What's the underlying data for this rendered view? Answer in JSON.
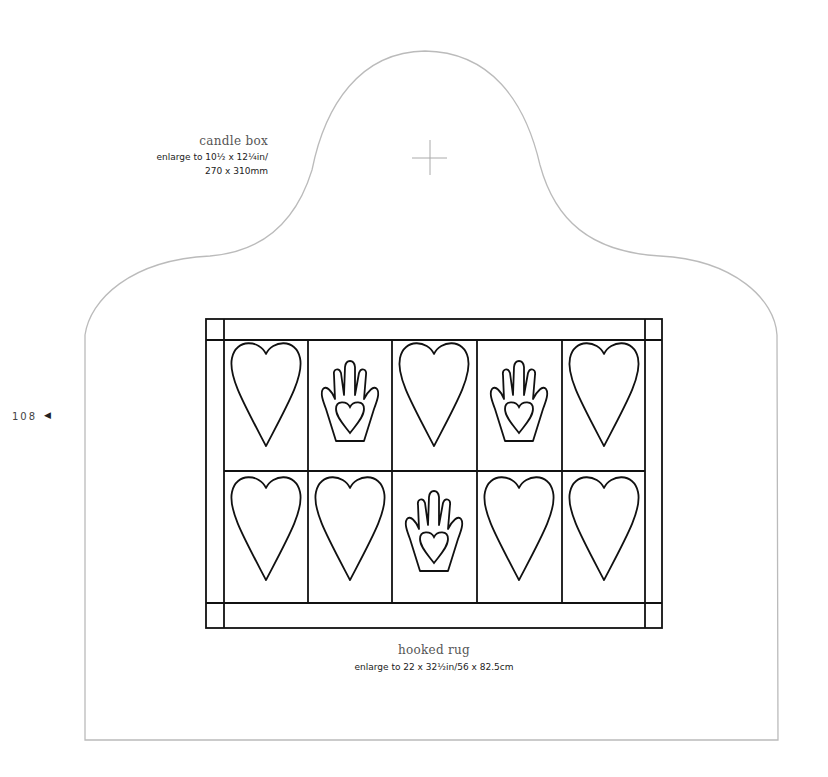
{
  "page": {
    "number": "108",
    "number_icon": "left-pointer-icon"
  },
  "candle_box": {
    "title": "candle box",
    "enlarge_line1": "enlarge to 10½ x 12¼in/",
    "enlarge_line2": "270 x 310mm",
    "center_mark_icon": "crosshair-icon"
  },
  "hooked_rug": {
    "title": "hooked rug",
    "enlarge": "enlarge to 22 x 32½in/56 x 82.5cm",
    "grid": {
      "rows": [
        [
          "heart",
          "hand-heart",
          "heart",
          "hand-heart",
          "heart"
        ],
        [
          "heart",
          "heart",
          "hand-heart",
          "heart",
          "heart"
        ]
      ]
    }
  },
  "colors": {
    "outline": "#bbbbbb",
    "ink": "#111111"
  }
}
